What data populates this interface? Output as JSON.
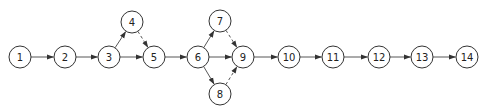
{
  "diagram": {
    "type": "activity-network",
    "node_radius": 11,
    "colors": {
      "stroke": "#333333",
      "edge": "#444444",
      "background": "#ffffff"
    },
    "nodes": [
      {
        "id": "1",
        "label": "1",
        "x": 20,
        "y": 57
      },
      {
        "id": "2",
        "label": "2",
        "x": 65,
        "y": 57
      },
      {
        "id": "3",
        "label": "3",
        "x": 109,
        "y": 57
      },
      {
        "id": "4",
        "label": "4",
        "x": 132,
        "y": 22
      },
      {
        "id": "5",
        "label": "5",
        "x": 154,
        "y": 57
      },
      {
        "id": "6",
        "label": "6",
        "x": 198,
        "y": 57
      },
      {
        "id": "7",
        "label": "7",
        "x": 220,
        "y": 21
      },
      {
        "id": "8",
        "label": "8",
        "x": 220,
        "y": 94
      },
      {
        "id": "9",
        "label": "9",
        "x": 243,
        "y": 57
      },
      {
        "id": "10",
        "label": "10",
        "x": 289,
        "y": 57
      },
      {
        "id": "11",
        "label": "11",
        "x": 333,
        "y": 57
      },
      {
        "id": "12",
        "label": "12",
        "x": 379,
        "y": 57
      },
      {
        "id": "13",
        "label": "13",
        "x": 422,
        "y": 57
      },
      {
        "id": "14",
        "label": "14",
        "x": 467,
        "y": 57
      }
    ],
    "edges": [
      {
        "from": "1",
        "to": "2",
        "style": "solid"
      },
      {
        "from": "2",
        "to": "3",
        "style": "solid"
      },
      {
        "from": "3",
        "to": "4",
        "style": "solid"
      },
      {
        "from": "3",
        "to": "5",
        "style": "solid"
      },
      {
        "from": "4",
        "to": "5",
        "style": "dashed"
      },
      {
        "from": "5",
        "to": "6",
        "style": "solid"
      },
      {
        "from": "6",
        "to": "7",
        "style": "solid"
      },
      {
        "from": "6",
        "to": "9",
        "style": "solid"
      },
      {
        "from": "6",
        "to": "8",
        "style": "solid"
      },
      {
        "from": "7",
        "to": "9",
        "style": "dashed"
      },
      {
        "from": "8",
        "to": "9",
        "style": "dashed"
      },
      {
        "from": "9",
        "to": "10",
        "style": "solid"
      },
      {
        "from": "10",
        "to": "11",
        "style": "solid"
      },
      {
        "from": "11",
        "to": "12",
        "style": "solid"
      },
      {
        "from": "12",
        "to": "13",
        "style": "solid"
      },
      {
        "from": "13",
        "to": "14",
        "style": "solid"
      }
    ]
  }
}
